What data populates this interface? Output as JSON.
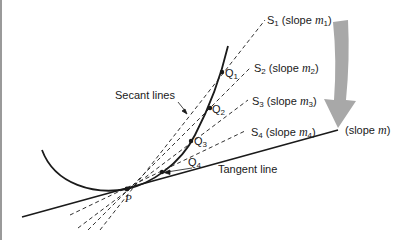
{
  "figure": {
    "colors": {
      "ink": "#1a1a1a",
      "arrow": "#a8a8a8",
      "border": "#9a9a9a",
      "background": "#ffffff"
    },
    "labels": {
      "secant_lines": "Secant lines",
      "tangent_line": "Tangent line",
      "slope_m": "(slope m)",
      "point_p": "P"
    },
    "secants": [
      {
        "name": "S",
        "index": "1",
        "slope_text": "(slope ",
        "slope_var": "m",
        "slope_index": "1",
        "close": ")"
      },
      {
        "name": "S",
        "index": "2",
        "slope_text": "(slope ",
        "slope_var": "m",
        "slope_index": "2",
        "close": ")"
      },
      {
        "name": "S",
        "index": "3",
        "slope_text": "(slope ",
        "slope_var": "m",
        "slope_index": "3",
        "close": ")"
      },
      {
        "name": "S",
        "index": "4",
        "slope_text": "(slope ",
        "slope_var": "m",
        "slope_index": "4",
        "close": ")"
      }
    ],
    "points": [
      {
        "name": "Q",
        "index": "1"
      },
      {
        "name": "Q",
        "index": "2"
      },
      {
        "name": "Q",
        "index": "3"
      },
      {
        "name": "Q",
        "index": "4"
      }
    ],
    "tangent": {
      "slope_prefix": "(slope ",
      "slope_var": "m",
      "slope_suffix": ")"
    }
  }
}
